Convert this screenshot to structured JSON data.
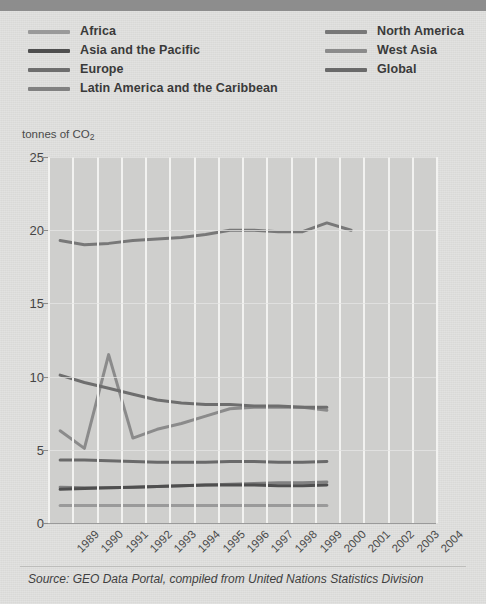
{
  "header": {
    "bar_color": "#8d8d8d"
  },
  "legend": {
    "columns": [
      {
        "items": [
          {
            "label": "Africa",
            "color": "#9a9a9a"
          },
          {
            "label": "Asia and the Pacific",
            "color": "#4f4f4f"
          },
          {
            "label": "Europe",
            "color": "#6e6e6e"
          },
          {
            "label": "Latin America and the Caribbean",
            "color": "#818181"
          }
        ]
      },
      {
        "items": [
          {
            "label": "North America",
            "color": "#787878"
          },
          {
            "label": "West Asia",
            "color": "#8b8b8b"
          },
          {
            "label": "Global",
            "color": "#6a6a6a"
          }
        ]
      }
    ]
  },
  "axis_caption": {
    "text": "tonnes of CO",
    "subscript": "2"
  },
  "source": {
    "text": "Source: GEO Data Portal, compiled from United Nations Statistics Division"
  },
  "chart_data": {
    "type": "line",
    "title": "",
    "xlabel": "",
    "ylabel": "tonnes of CO2",
    "ylim": [
      0,
      25
    ],
    "yticks": [
      0,
      5,
      10,
      15,
      20,
      25
    ],
    "grid": true,
    "legend_position": "top",
    "categories": [
      "1989",
      "1990",
      "1991",
      "1992",
      "1993",
      "1994",
      "1995",
      "1996",
      "1997",
      "1998",
      "1999",
      "2000",
      "2001",
      "2002",
      "2003",
      "2004"
    ],
    "series": [
      {
        "name": "North America",
        "color": "#787878",
        "values": [
          19.3,
          19.0,
          19.1,
          19.3,
          19.4,
          19.5,
          19.7,
          20.0,
          20.0,
          19.9,
          19.9,
          20.5,
          20.0,
          null,
          null,
          null
        ]
      },
      {
        "name": "West Asia",
        "color": "#8b8b8b",
        "values": [
          6.3,
          5.1,
          11.5,
          5.8,
          6.4,
          6.8,
          7.3,
          7.8,
          7.9,
          7.9,
          7.9,
          7.7,
          null,
          null,
          null,
          null
        ]
      },
      {
        "name": "Europe",
        "color": "#6e6e6e",
        "values": [
          10.1,
          9.6,
          9.2,
          8.8,
          8.4,
          8.2,
          8.1,
          8.1,
          8.0,
          8.0,
          7.9,
          7.9,
          null,
          null,
          null,
          null
        ]
      },
      {
        "name": "Global",
        "color": "#6a6a6a",
        "values": [
          4.3,
          4.3,
          4.25,
          4.2,
          4.15,
          4.15,
          4.15,
          4.2,
          4.2,
          4.15,
          4.15,
          4.2,
          null,
          null,
          null,
          null
        ]
      },
      {
        "name": "Latin America and the Caribbean",
        "color": "#818181",
        "values": [
          2.45,
          2.4,
          2.4,
          2.45,
          2.5,
          2.55,
          2.6,
          2.65,
          2.7,
          2.75,
          2.75,
          2.8,
          null,
          null,
          null,
          null
        ]
      },
      {
        "name": "Asia and the Pacific",
        "color": "#4f4f4f",
        "values": [
          2.3,
          2.35,
          2.4,
          2.45,
          2.5,
          2.55,
          2.6,
          2.6,
          2.6,
          2.55,
          2.55,
          2.6,
          null,
          null,
          null,
          null
        ]
      },
      {
        "name": "Africa",
        "color": "#9a9a9a",
        "values": [
          1.2,
          1.2,
          1.2,
          1.2,
          1.2,
          1.2,
          1.2,
          1.2,
          1.2,
          1.2,
          1.2,
          1.2,
          null,
          null,
          null,
          null
        ]
      }
    ]
  }
}
